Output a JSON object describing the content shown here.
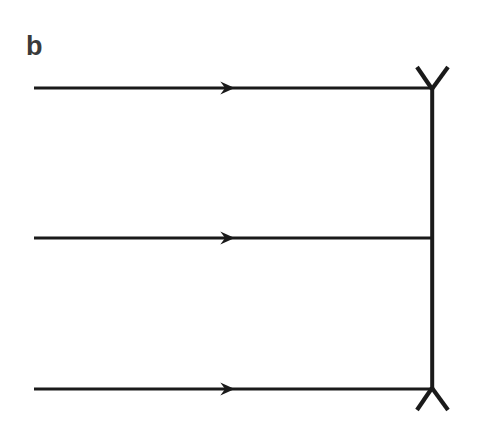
{
  "figure": {
    "panel_label": "b",
    "background_color": "#ffffff",
    "stroke_color": "#1a1a1a",
    "label_color": "#3a3a3a",
    "width": 479,
    "height": 427
  },
  "chart_data": {
    "type": "diagram",
    "title": "b",
    "xlabel": "",
    "ylabel": "",
    "grid": false,
    "legend": null,
    "elements": {
      "horizontal_lines": [
        {
          "name": "top-line",
          "x1": 34,
          "x2": 432,
          "y": 88,
          "arrow": true,
          "arrow_x": 232,
          "arrow_direction": "right"
        },
        {
          "name": "middle-line",
          "x1": 34,
          "x2": 432,
          "y": 238,
          "arrow": true,
          "arrow_x": 232,
          "arrow_direction": "right"
        },
        {
          "name": "bottom-line",
          "x1": 34,
          "x2": 432,
          "y": 389,
          "arrow": true,
          "arrow_x": 232,
          "arrow_direction": "right"
        }
      ],
      "vertical_line": {
        "name": "right-connector",
        "x": 432,
        "y1": 88,
        "y2": 389
      },
      "vertices": [
        {
          "name": "top-vertex",
          "shape": "Y",
          "x": 432,
          "y": 88,
          "branch_left_x": 417,
          "branch_left_y": 67,
          "branch_right_x": 448,
          "branch_right_y": 67
        },
        {
          "name": "bottom-vertex",
          "shape": "inverted-Y",
          "x": 432,
          "y": 389,
          "branch_left_x": 417,
          "branch_left_y": 410,
          "branch_right_x": 448,
          "branch_right_y": 410
        }
      ],
      "junctions": [
        {
          "name": "middle-t-junction",
          "x": 432,
          "y": 238,
          "type": "T"
        }
      ]
    },
    "line_width": 3.2,
    "vertex_line_width": 4.2
  }
}
